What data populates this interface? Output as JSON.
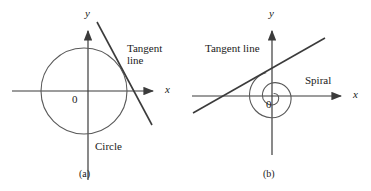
{
  "figure": {
    "width": 371,
    "height": 191,
    "background_color": "#ffffff",
    "stroke_color": "#3b3b3b",
    "text_color": "#1a1a1a"
  },
  "panel_a": {
    "tag": "(a)",
    "y_axis_label": "y",
    "x_axis_label": "x",
    "origin_label": "0",
    "tangent_label": "Tangent\nline",
    "curve_label": "Circle",
    "curve_type": "circle",
    "circle": {
      "cx": 84,
      "cy": 91,
      "r": 43
    },
    "axes": {
      "x_from": [
        12,
        91
      ],
      "x_to": [
        160,
        91
      ],
      "y_from": [
        88,
        180
      ],
      "y_to": [
        88,
        24
      ]
    },
    "tangent_line": {
      "from": [
        97,
        22
      ],
      "to": [
        152,
        125
      ]
    }
  },
  "panel_b": {
    "tag": "(b)",
    "y_axis_label": "y",
    "x_axis_label": "x",
    "origin_label": "0",
    "tangent_label": "Tangent line",
    "curve_label": "Spiral",
    "curve_type": "spiral",
    "spiral": {
      "cx": 273,
      "cy": 96,
      "turns": 2,
      "r_max": 25
    },
    "axes": {
      "x_from": [
        192,
        96
      ],
      "x_to": [
        348,
        96
      ],
      "y_from": [
        272,
        155
      ],
      "y_to": [
        272,
        24
      ]
    },
    "tangent_line": {
      "from": [
        193,
        113
      ],
      "to": [
        325,
        38
      ]
    }
  }
}
